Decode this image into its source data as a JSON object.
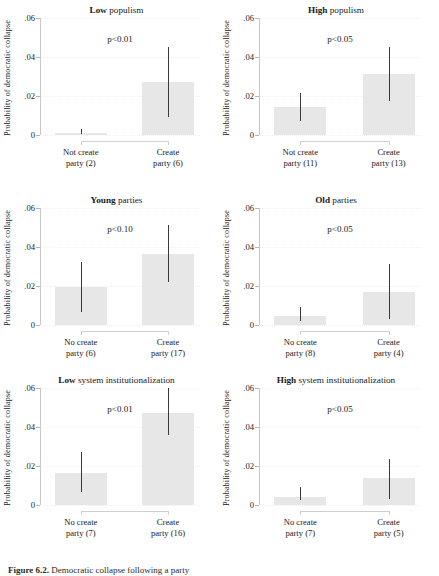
{
  "figure": {
    "caption_prefix": "Figure 6.2.",
    "caption_rest": " Democratic collapse following a party"
  },
  "axis": {
    "ylabel": "Probability of democratic collapse",
    "yticks": [
      "0",
      ".02",
      ".04",
      ".06"
    ],
    "ytick_values": [
      0,
      0.02,
      0.04,
      0.06
    ],
    "ylim": [
      0,
      0.06
    ]
  },
  "chart_data": {
    "type": "bar",
    "xlabel": "",
    "ylabel": "Probability of democratic collapse",
    "ylim": [
      0,
      0.06
    ],
    "yticks": [
      0,
      0.02,
      0.04,
      0.06
    ],
    "ytick_labels": [
      "0",
      ".02",
      ".04",
      ".06"
    ],
    "grid": true,
    "legend": "none",
    "error_bars": "95% confidence interval",
    "panels": [
      {
        "id": "low-populism",
        "title_strong": "Low",
        "title_normal": " populism",
        "annotation": "p<0.01",
        "categories": [
          "Not create\nparty (2)",
          "Create\nparty (6)"
        ],
        "category_lines": [
          [
            "Not create",
            "party (2)"
          ],
          [
            "Create",
            "party (6)"
          ]
        ],
        "values": [
          0.0012,
          0.027
        ],
        "ci_low": [
          0.0004,
          0.009
        ],
        "ci_high": [
          0.003,
          0.0452
        ],
        "n": [
          2,
          6
        ]
      },
      {
        "id": "high-populism",
        "title_strong": "High",
        "title_normal": " populism",
        "annotation": "p<0.05",
        "categories": [
          "Not create\nparty (11)",
          "Create\nparty (13)"
        ],
        "category_lines": [
          [
            "Not create",
            "party (11)"
          ],
          [
            "Create",
            "party (13)"
          ]
        ],
        "values": [
          0.0145,
          0.0315
        ],
        "ci_low": [
          0.007,
          0.0175
        ],
        "ci_high": [
          0.0215,
          0.0452
        ],
        "n": [
          11,
          13
        ]
      },
      {
        "id": "young-parties",
        "title_strong": "Young",
        "title_normal": " parties",
        "annotation": "p<0.10",
        "categories": [
          "No create\nparty (6)",
          "Create\nparty (17)"
        ],
        "category_lines": [
          [
            "No create",
            "party (6)"
          ],
          [
            "Create",
            "party (17)"
          ]
        ],
        "values": [
          0.0195,
          0.0365
        ],
        "ci_low": [
          0.0065,
          0.022
        ],
        "ci_high": [
          0.0325,
          0.0515
        ],
        "n": [
          6,
          17
        ]
      },
      {
        "id": "old-parties",
        "title_strong": "Old",
        "title_normal": " parties",
        "annotation": "p<0.05",
        "categories": [
          "No create\nparty (8)",
          "Create\nparty (4)"
        ],
        "category_lines": [
          [
            "No create",
            "party (8)"
          ],
          [
            "Create",
            "party (4)"
          ]
        ],
        "values": [
          0.0047,
          0.0168
        ],
        "ci_low": [
          0.0022,
          0.003
        ],
        "ci_high": [
          0.009,
          0.0315
        ],
        "n": [
          8,
          4
        ]
      },
      {
        "id": "low-system-institutionalization",
        "title_strong": "Low",
        "title_normal": " system institutionalization",
        "annotation": "p<0.01",
        "categories": [
          "No create\nparty (7)",
          "Create\nparty (16)"
        ],
        "category_lines": [
          [
            "No create",
            "party (7)"
          ],
          [
            "Create",
            "party (16)"
          ]
        ],
        "values": [
          0.0165,
          0.047
        ],
        "ci_low": [
          0.0065,
          0.036
        ],
        "ci_high": [
          0.027,
          0.06
        ],
        "n": [
          7,
          16
        ]
      },
      {
        "id": "high-system-institutionalization",
        "title_strong": "High",
        "title_normal": " system institutionalization",
        "annotation": "p<0.05",
        "categories": [
          "No create\nparty (7)",
          "Create\nparty (5)"
        ],
        "category_lines": [
          [
            "No create",
            "party (7)"
          ],
          [
            "Create",
            "party (5)"
          ]
        ],
        "values": [
          0.004,
          0.014
        ],
        "ci_low": [
          0.0025,
          0.003
        ],
        "ci_high": [
          0.009,
          0.0235
        ],
        "n": [
          7,
          5
        ]
      }
    ]
  },
  "colors": {
    "bar_fill": "#e7e7e7",
    "error_bar": "#3a3a3a",
    "axis": "#c9c9c9",
    "text": "#1a1a1a"
  }
}
